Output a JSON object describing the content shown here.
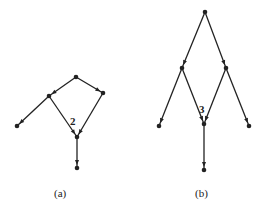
{
  "figures": [
    {
      "id": "a",
      "caption": "(a)",
      "node_label": "2",
      "nodes": [
        {
          "x": 76,
          "y": 77
        },
        {
          "x": 49,
          "y": 96
        },
        {
          "x": 103,
          "y": 93
        },
        {
          "x": 17,
          "y": 126
        },
        {
          "x": 77,
          "y": 137
        },
        {
          "x": 77,
          "y": 168
        }
      ],
      "edges": [
        [
          0,
          1
        ],
        [
          0,
          2
        ],
        [
          1,
          3
        ],
        [
          1,
          4
        ],
        [
          2,
          4
        ],
        [
          4,
          5
        ]
      ]
    },
    {
      "id": "b",
      "caption": "(b)",
      "node_label": "3",
      "nodes": [
        {
          "x": 205,
          "y": 12
        },
        {
          "x": 182,
          "y": 68
        },
        {
          "x": 226,
          "y": 68
        },
        {
          "x": 159,
          "y": 126
        },
        {
          "x": 204,
          "y": 124
        },
        {
          "x": 249,
          "y": 126
        },
        {
          "x": 204,
          "y": 170
        }
      ],
      "edges": [
        [
          0,
          1
        ],
        [
          0,
          2
        ],
        [
          1,
          3
        ],
        [
          1,
          4
        ],
        [
          2,
          4
        ],
        [
          2,
          5
        ],
        [
          4,
          6
        ]
      ]
    }
  ],
  "colors": {
    "line": "#222222",
    "background": "#ffffff"
  }
}
